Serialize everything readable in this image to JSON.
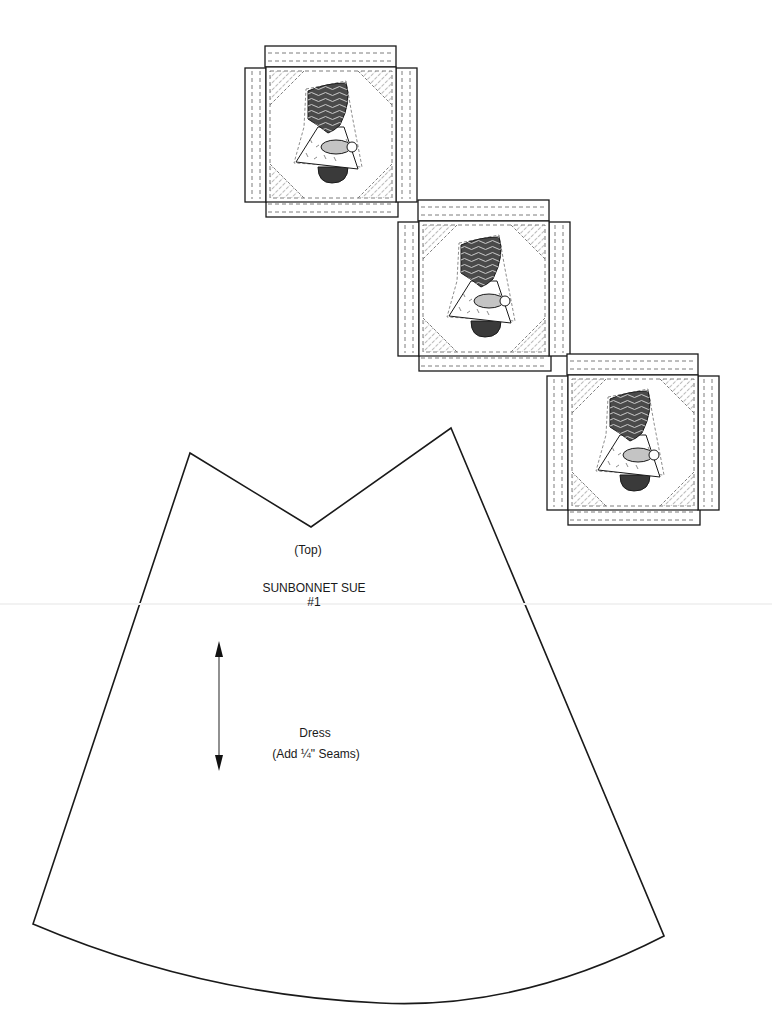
{
  "blocks": [
    {
      "id": 1,
      "x": 266,
      "y": 67,
      "size": 130,
      "strip": 21,
      "label": "sunbonnet-sue-block-1"
    },
    {
      "id": 2,
      "x": 419,
      "y": 221,
      "size": 129,
      "strip": 21,
      "label": "sunbonnet-sue-block-2"
    },
    {
      "id": 3,
      "x": 568,
      "y": 375,
      "size": 129,
      "strip": 21,
      "label": "sunbonnet-sue-block-3"
    }
  ],
  "colors": {
    "line": "#1a1a1a",
    "dash": "#6e6e6e",
    "bonnet": "#4a4a4a",
    "bonnet_wave": "#bdbdbd",
    "arm": "#c4c4c4",
    "shoe": "#3a3a3a",
    "dress": "#ffffff"
  },
  "pattern_piece": {
    "name": "Dress",
    "top_label": "(Top)",
    "title_line1": "SUNBONNET SUE",
    "title_line2": "#1",
    "piece_label": "Dress",
    "seam_note": "(Add ¼\" Seams)",
    "grainline": {
      "x": 219,
      "y1": 642,
      "y2": 770
    }
  }
}
